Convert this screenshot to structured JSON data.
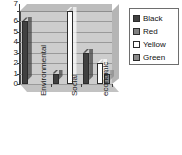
{
  "chart_data": {
    "type": "bar",
    "title": "",
    "xlabel": "",
    "ylabel": "",
    "categories": [
      "Environmental",
      "Social",
      "economic"
    ],
    "series": [
      {
        "name": "Black",
        "color": "#404040",
        "values": [
          6,
          1,
          3
        ]
      },
      {
        "name": "Red",
        "color": "#808080",
        "values": [
          0,
          0,
          0
        ]
      },
      {
        "name": "Yellow",
        "color": "#ffffff",
        "values": [
          0,
          7,
          2
        ]
      },
      {
        "name": "Green",
        "color": "#8a8a8a",
        "values": [
          0,
          0,
          1
        ]
      }
    ],
    "ylim": [
      0,
      7
    ],
    "yticks": [
      "0",
      "1",
      "2",
      "3",
      "4",
      "5",
      "6",
      "7"
    ],
    "grid": true,
    "legend_position": "right",
    "style": "3d-column"
  },
  "legend": {
    "items": [
      {
        "label": "Black",
        "swatch": "black-swatch"
      },
      {
        "label": "Red",
        "swatch": "red-swatch"
      },
      {
        "label": "Yellow",
        "swatch": "yellow-swatch"
      },
      {
        "label": "Green",
        "swatch": "green-swatch"
      }
    ]
  },
  "colors": {
    "plot_background": "#cdcdcd",
    "gridline": "#9a9a9a",
    "axis": "#3d3d3d",
    "legend_border": "#6e6e6e",
    "page_background": "#ffffff"
  }
}
